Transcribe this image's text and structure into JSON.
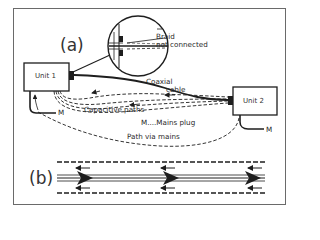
{
  "figure": {
    "part_a_label": "(a)",
    "part_b_label": "(b)",
    "units": [
      {
        "id": "unit1",
        "label": "Unit 1"
      },
      {
        "id": "unit2",
        "label": "Unit 2"
      }
    ],
    "annotations": {
      "braid_line1": "Braid",
      "braid_line2": "not connected",
      "coax_line1": "Coaxial",
      "coax_line2": "cable",
      "capacitive": "Capacitive paths",
      "mains_plug": "M....Mains plug",
      "path_mains": "Path via mains",
      "m_left": "M",
      "m_right": "M"
    },
    "colors": {
      "line": "#1e1e1e",
      "frame": "#6a6a6a",
      "background": "#ffffff"
    }
  }
}
